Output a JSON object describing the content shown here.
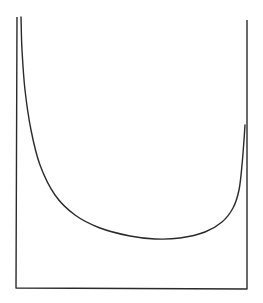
{
  "diagram": {
    "stroke_color": "#2a2a2a",
    "background": "#ffffff",
    "box": {
      "left_x": 17,
      "right_x": 247,
      "bottom_y": 288,
      "left_top_y": 17,
      "right_top_y": 20
    },
    "curve": {
      "points": [
        [
          21,
          17
        ],
        [
          22,
          50
        ],
        [
          25,
          90
        ],
        [
          31,
          130
        ],
        [
          40,
          165
        ],
        [
          55,
          195
        ],
        [
          75,
          215
        ],
        [
          100,
          228
        ],
        [
          130,
          236
        ],
        [
          155,
          239
        ],
        [
          180,
          238
        ],
        [
          205,
          232
        ],
        [
          222,
          222
        ],
        [
          233,
          208
        ],
        [
          239,
          190
        ],
        [
          242,
          165
        ],
        [
          244,
          140
        ],
        [
          245,
          125
        ]
      ]
    }
  }
}
